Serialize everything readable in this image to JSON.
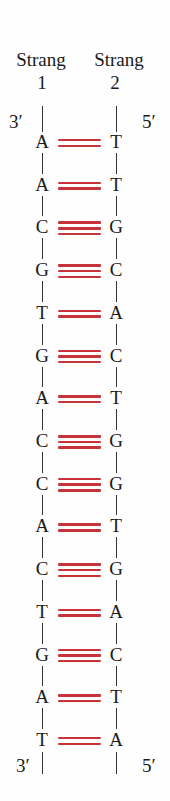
{
  "colors": {
    "bond": "#c8323a",
    "text": "#1a1a1a",
    "backbone": "#333333"
  },
  "strand1": {
    "title": "Strang",
    "number": "1",
    "end_top": "3′",
    "end_bottom": "3′"
  },
  "strand2": {
    "title": "Strang",
    "number": "2",
    "end_top": "5′",
    "end_bottom": "5′"
  },
  "pairs": [
    {
      "left": "A",
      "right": "T",
      "bonds": 2
    },
    {
      "left": "A",
      "right": "T",
      "bonds": 2
    },
    {
      "left": "C",
      "right": "G",
      "bonds": 3
    },
    {
      "left": "G",
      "right": "C",
      "bonds": 3
    },
    {
      "left": "T",
      "right": "A",
      "bonds": 2
    },
    {
      "left": "G",
      "right": "C",
      "bonds": 3
    },
    {
      "left": "A",
      "right": "T",
      "bonds": 2
    },
    {
      "left": "C",
      "right": "G",
      "bonds": 3
    },
    {
      "left": "C",
      "right": "G",
      "bonds": 3
    },
    {
      "left": "A",
      "right": "T",
      "bonds": 2
    },
    {
      "left": "C",
      "right": "G",
      "bonds": 3
    },
    {
      "left": "T",
      "right": "A",
      "bonds": 2
    },
    {
      "left": "G",
      "right": "C",
      "bonds": 3
    },
    {
      "left": "A",
      "right": "T",
      "bonds": 2
    },
    {
      "left": "T",
      "right": "A",
      "bonds": 2
    }
  ]
}
